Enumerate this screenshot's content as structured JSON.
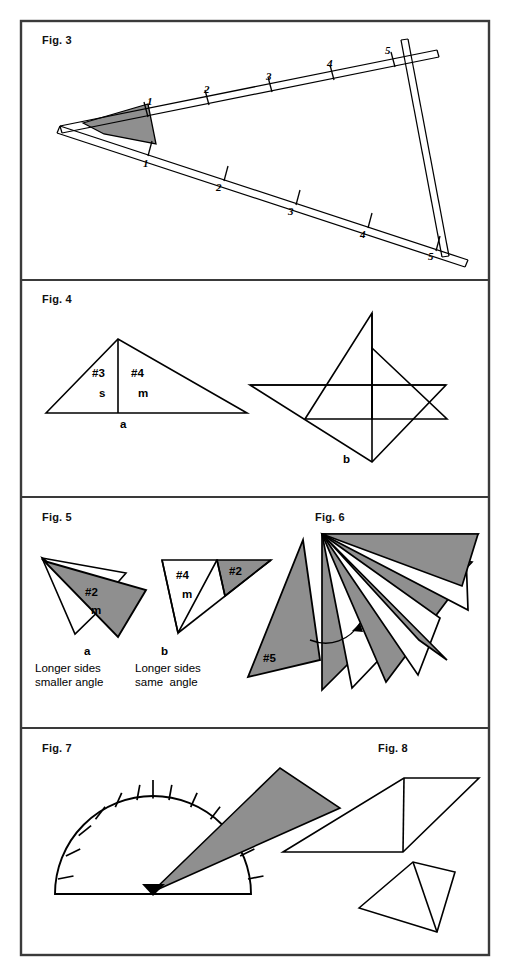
{
  "page": {
    "width": 510,
    "height": 969,
    "background": "#ffffff",
    "border_color": "#3a3a3a",
    "ink_color": "#000000",
    "shade_color": "#9a9a9a"
  },
  "panels": [
    {
      "id": "panel-fig3",
      "label": "Fig. 3"
    },
    {
      "id": "panel-fig4",
      "label": "Fig. 4"
    },
    {
      "id": "panel-fig5",
      "label": "Fig. 5"
    },
    {
      "id": "panel-fig7",
      "label": "Fig. 7"
    }
  ],
  "fig3": {
    "label": "Fig. 3",
    "description": "Two long double-line straightedges crossing at a left apex, each marked with tick numbers, joined at mark 5 by a third straightedge; the angle at the apex is shaded.",
    "upper_ticks": [
      "1",
      "2",
      "3",
      "4",
      "5"
    ],
    "lower_ticks": [
      "1",
      "2",
      "3",
      "4",
      "5"
    ]
  },
  "fig4": {
    "label": "Fig. 4",
    "left_labels": {
      "angle_upper": "#3",
      "angle_lower": "s",
      "side_upper": "#4",
      "side_lower": "m",
      "base": "a"
    },
    "right_labels": {
      "vertex": "b"
    }
  },
  "fig5": {
    "label": "Fig. 5",
    "shape_a": {
      "tag": "a",
      "angle_label": "#2",
      "size_label": "m",
      "caption_line1": "Longer sides",
      "caption_line2": "smaller angle"
    },
    "shape_b": {
      "tag": "b",
      "angle_label_left": "#4",
      "size_label_left": "m",
      "angle_label_right": "#2",
      "caption_line1": "Longer sides",
      "caption_line2": "same  angle"
    }
  },
  "fig6": {
    "label": "Fig. 6",
    "wedge_label": "#5",
    "description": "A fan of nested triangles radiating from a common top-left apex, alternately shaded and white, with a detached shaded sliver labelled #5 connected by an arrow."
  },
  "fig7": {
    "label": "Fig. 7",
    "description": "A semicircular protractor with graduation ticks and a shaded wedge pivoting from the centre point.",
    "tick_count": 12
  },
  "fig8": {
    "label": "Fig. 8",
    "description": "A parallelogram divided by a vertical line and, below it, a quadrilateral divided by an internal line."
  }
}
